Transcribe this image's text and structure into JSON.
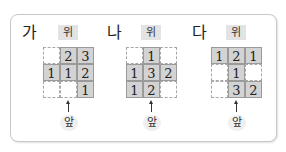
{
  "figures": [
    {
      "label": "가",
      "top_label": "위",
      "front_label": "앞",
      "cells": [
        [
          "",
          "2",
          "3"
        ],
        [
          "1",
          "1",
          "2"
        ],
        [
          "",
          "",
          "1"
        ]
      ]
    },
    {
      "label": "나",
      "top_label": "위",
      "front_label": "앞",
      "cells": [
        [
          "",
          "1",
          ""
        ],
        [
          "1",
          "3",
          "2"
        ],
        [
          "1",
          "2",
          ""
        ]
      ]
    },
    {
      "label": "다",
      "top_label": "위",
      "front_label": "앞",
      "cells": [
        [
          "1",
          "2",
          "1"
        ],
        [
          "",
          "1",
          ""
        ],
        [
          "",
          "3",
          "2"
        ]
      ]
    }
  ],
  "colors": {
    "filled_cell": "#d3d3d3",
    "cell_border": "#9a9a9a",
    "label_bg": "#e3e3e3",
    "panel_border": "#c8c8c8"
  }
}
